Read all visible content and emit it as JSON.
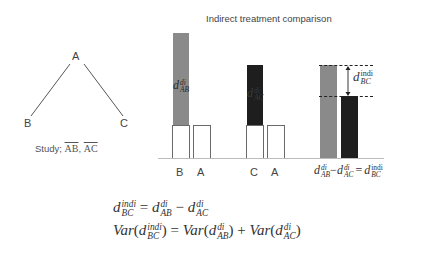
{
  "network": {
    "nodes": [
      {
        "id": "A",
        "label": "A"
      },
      {
        "id": "B",
        "label": "B"
      },
      {
        "id": "C",
        "label": "C"
      }
    ],
    "edges": [
      [
        "A",
        "B"
      ],
      [
        "A",
        "C"
      ]
    ],
    "study_prefix": "Study; ",
    "study_items": [
      "AB",
      "AC"
    ],
    "study_sep": ", "
  },
  "chart": {
    "title": "Indirect treatment comparison",
    "groups": [
      {
        "labels": [
          "B",
          "A"
        ],
        "bar_label": {
          "base": "d",
          "sup": "di",
          "sub": "AB"
        }
      },
      {
        "labels": [
          "C",
          "A"
        ],
        "bar_label": {
          "base": "d",
          "sup": "di",
          "sub": "AC"
        }
      }
    ],
    "diff_label": {
      "base": "d",
      "sup": "indi",
      "sub": "BC"
    },
    "comparison": {
      "lhs1": {
        "base": "d",
        "sup": "di",
        "sub": "AB"
      },
      "op1": "−",
      "lhs2": {
        "base": "d",
        "sup": "di",
        "sub": "AC"
      },
      "op2": "=",
      "rhs": {
        "base": "d",
        "sup": "indi",
        "sub": "BC"
      }
    },
    "colors": {
      "grey": "#8a8a8a",
      "black": "#1e1e1e",
      "white_box_border": "#6a6a6a"
    }
  },
  "equations": {
    "line1": {
      "lhs": {
        "base": "d",
        "sup": "indi",
        "sub": "BC"
      },
      "eq": " = ",
      "t1": {
        "base": "d",
        "sup": "di",
        "sub": "AB"
      },
      "op": " − ",
      "t2": {
        "base": "d",
        "sup": "di",
        "sub": "AC"
      }
    },
    "line2": {
      "var": "Var",
      "open": "(",
      "close": ")",
      "eq": " = ",
      "plus": " + ",
      "lhs": {
        "base": "d",
        "sup": "indi",
        "sub": "BC"
      },
      "t1": {
        "base": "d",
        "sup": "di",
        "sub": "AB"
      },
      "t2": {
        "base": "d",
        "sup": "di",
        "sub": "AC"
      }
    }
  }
}
